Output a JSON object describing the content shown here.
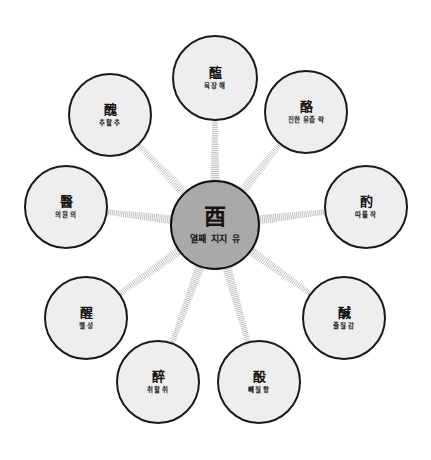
{
  "diagram": {
    "type": "radial-hub-and-spoke",
    "background_color": "#ffffff",
    "center_fill": "#a9a9a9",
    "node_fill": "#eeeeee",
    "node_stroke": "#1a1a1a",
    "spoke_color": "#b4b4b4",
    "center": {
      "han": "酉",
      "gloss": "열째 지지 유",
      "cx": 215,
      "cy": 225,
      "r": 45
    },
    "nodes": [
      {
        "id": "node-hae",
        "han": "醢",
        "gloss": "육장 해",
        "cx": 215,
        "cy": 78,
        "r": 43,
        "position": "top"
      },
      {
        "id": "node-rak",
        "han": "酪",
        "gloss": "진한 유즙 락",
        "cx": 306,
        "cy": 112,
        "r": 42,
        "position": "top-right"
      },
      {
        "id": "node-jak",
        "han": "酌",
        "gloss": "따를 작",
        "cx": 366,
        "cy": 207,
        "r": 42,
        "position": "right"
      },
      {
        "id": "node-gam",
        "han": "醎",
        "gloss": "줄질 감",
        "cx": 344,
        "cy": 318,
        "r": 42,
        "position": "bottom-right-upper"
      },
      {
        "id": "node-hang",
        "han": "酘",
        "gloss": "빼질 항",
        "cx": 259,
        "cy": 382,
        "r": 42,
        "position": "bottom-right"
      },
      {
        "id": "node-chwi",
        "han": "醉",
        "gloss": "취할 취",
        "cx": 158,
        "cy": 382,
        "r": 42,
        "position": "bottom-left"
      },
      {
        "id": "node-seong",
        "han": "醒",
        "gloss": "깰 성",
        "cx": 86,
        "cy": 318,
        "r": 42,
        "position": "bottom-left-upper"
      },
      {
        "id": "node-ui",
        "han": "醫",
        "gloss": "의원 의",
        "cx": 66,
        "cy": 207,
        "r": 42,
        "position": "left"
      },
      {
        "id": "node-chu",
        "han": "醜",
        "gloss": "추할 추",
        "cx": 110,
        "cy": 115,
        "r": 42,
        "position": "top-left"
      }
    ]
  }
}
